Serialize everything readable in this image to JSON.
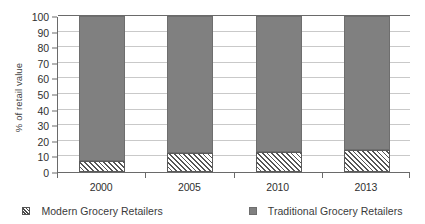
{
  "chart_data": {
    "type": "bar",
    "stacked": true,
    "title": "",
    "xlabel": "",
    "ylabel": "% of retail value",
    "categories": [
      "2000",
      "2005",
      "2010",
      "2013"
    ],
    "ylim": [
      0,
      100
    ],
    "yticks": [
      0,
      10,
      20,
      30,
      40,
      50,
      60,
      70,
      80,
      90,
      100
    ],
    "grid": true,
    "legend_position": "bottom",
    "series": [
      {
        "name": "Modern Grocery Retailers",
        "values": [
          7,
          12,
          13,
          14
        ],
        "pattern": "diagonal-hatch",
        "color": "#ffffff"
      },
      {
        "name": "Traditional Grocery Retailers",
        "values": [
          93,
          88,
          87,
          86
        ],
        "pattern": "solid",
        "color": "#808080"
      }
    ]
  },
  "legend": {
    "items": [
      {
        "label": "Modern Grocery Retailers",
        "swatch": "hatched-square-icon"
      },
      {
        "label": "Traditional Grocery Retailers",
        "swatch": "gray-square-icon"
      }
    ]
  }
}
